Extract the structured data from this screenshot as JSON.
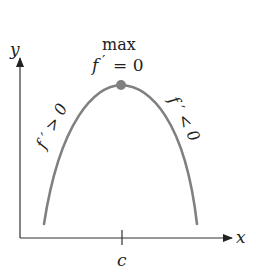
{
  "diagram": {
    "axes": {
      "x_label": "x",
      "y_label": "y",
      "tick_label": "c"
    },
    "annotations": {
      "max_label": "max",
      "top_eq_f": "f",
      "top_eq_prime": "′",
      "top_eq_rest": "= 0",
      "left_label": "f ′ > 0",
      "right_label": "f ′ < 0"
    },
    "colors": {
      "curve": "#808080",
      "axis": "#333333",
      "point": "#808080"
    }
  }
}
